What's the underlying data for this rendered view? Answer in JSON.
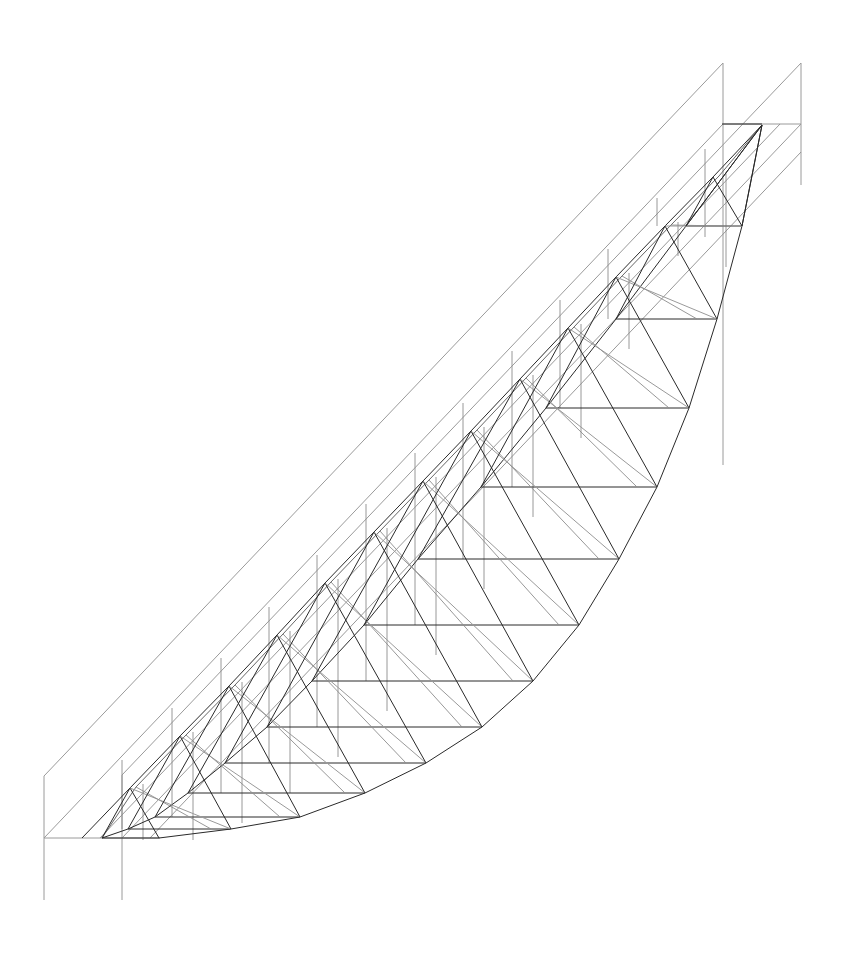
{
  "diagram": {
    "type": "line-drawing",
    "colors": {
      "background": "#ffffff",
      "structure": "#2a2a2a",
      "projection": "#9a9a9a",
      "secondary": "#555555"
    },
    "frame": {
      "left_verticals": [
        {
          "x": 44,
          "y1": 776,
          "y2": 900
        },
        {
          "x": 122,
          "y1": 775,
          "y2": 900
        }
      ],
      "right_verticals": [
        {
          "x": 723,
          "y1": 63,
          "y2": 465
        },
        {
          "x": 801,
          "y1": 63,
          "y2": 185
        }
      ],
      "top_rail": {
        "y": 124,
        "x1": 723,
        "x2": 801
      },
      "bottom_rail": {
        "y": 838,
        "x1": 44,
        "x2": 160
      }
    },
    "apex": [
      762,
      125
    ],
    "peaks": [
      [
        130,
        788
      ],
      [
        180,
        736
      ],
      [
        229,
        686
      ],
      [
        277,
        635
      ],
      [
        325,
        583
      ],
      [
        374,
        532
      ],
      [
        423,
        481
      ],
      [
        471,
        431
      ],
      [
        520,
        379
      ],
      [
        568,
        328
      ],
      [
        616,
        277
      ],
      [
        665,
        226
      ],
      [
        713,
        177
      ]
    ],
    "arc_nodes": [
      [
        159,
        838
      ],
      [
        231,
        829
      ],
      [
        300,
        817
      ],
      [
        365,
        793
      ],
      [
        426,
        763
      ],
      [
        482,
        727
      ],
      [
        533,
        681
      ],
      [
        579,
        625
      ],
      [
        619,
        559
      ],
      [
        657,
        487
      ],
      [
        689,
        408
      ],
      [
        717,
        319
      ],
      [
        742,
        226
      ]
    ],
    "inner_chord_nodes": [
      [
        102,
        838
      ],
      [
        128,
        829
      ],
      [
        155,
        817
      ],
      [
        188,
        793
      ],
      [
        225,
        763
      ],
      [
        267,
        727
      ],
      [
        312,
        681
      ],
      [
        364,
        625
      ],
      [
        418,
        559
      ],
      [
        481,
        487
      ],
      [
        546,
        408
      ],
      [
        616,
        319
      ],
      [
        686,
        226
      ]
    ],
    "start_node": [
      82,
      838
    ]
  }
}
